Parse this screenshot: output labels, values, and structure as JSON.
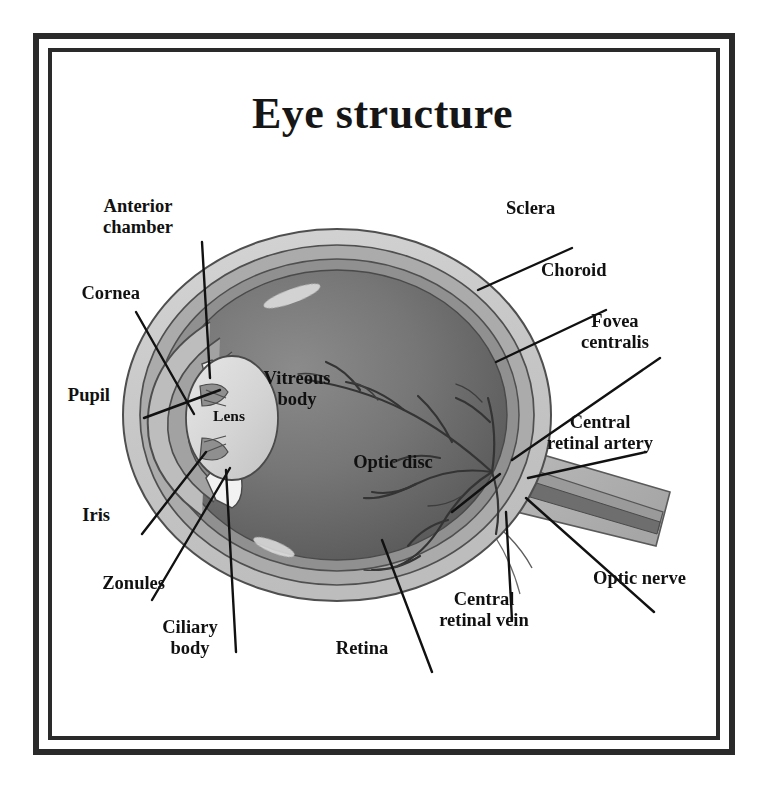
{
  "document": {
    "title": "Eye structure",
    "type": "anatomical-diagram",
    "frame": {
      "style": "double-rule",
      "color": "#2a2a2a"
    }
  },
  "palette": {
    "ink": "#161616",
    "background": "#ffffff",
    "sclera": "#c9c9c9",
    "choroid": "#a3a3a3",
    "retina": "#8d8d8d",
    "vitreous": "#6f6f6f",
    "vitreous_dark": "#5a5a5a",
    "lens": "#d7d7d7",
    "cornea": "#b5b5b5",
    "iris": "#8a8a8a",
    "nerve": "#b0b0b0",
    "vessel": "#3a3a3a"
  },
  "labels": [
    {
      "id": "anterior-chamber",
      "text": "Anterior\nchamber",
      "align": "center",
      "x": 138,
      "y": 196
    },
    {
      "id": "cornea",
      "text": "Cornea",
      "align": "right",
      "x": 30,
      "y": 283
    },
    {
      "id": "pupil",
      "text": "Pupil",
      "align": "right",
      "x": 30,
      "y": 385
    },
    {
      "id": "iris",
      "text": "Iris",
      "align": "right",
      "x": 30,
      "y": 505
    },
    {
      "id": "zonules",
      "text": "Zonules",
      "align": "right",
      "x": 30,
      "y": 573
    },
    {
      "id": "ciliary-body",
      "text": "Ciliary\nbody",
      "align": "center",
      "x": 190,
      "y": 617
    },
    {
      "id": "retina",
      "text": "Retina",
      "align": "center",
      "x": 362,
      "y": 638
    },
    {
      "id": "central-retinal-vein",
      "text": "Central\nretinal vein",
      "align": "center",
      "x": 484,
      "y": 589
    },
    {
      "id": "optic-nerve",
      "text": "Optic nerve",
      "align": "left",
      "x": 593,
      "y": 568
    },
    {
      "id": "central-retinal-artery",
      "text": "Central\nretinal artery",
      "align": "center",
      "x": 598,
      "y": 412
    },
    {
      "id": "fovea-centralis",
      "text": "Fovea\ncentralis",
      "align": "center",
      "x": 615,
      "y": 311
    },
    {
      "id": "choroid",
      "text": "Choroid",
      "align": "left",
      "x": 541,
      "y": 260
    },
    {
      "id": "sclera",
      "text": "Sclera",
      "align": "left",
      "x": 506,
      "y": 198
    },
    {
      "id": "vitreous-body",
      "text": "Vitreous\nbody",
      "align": "center",
      "x": 297,
      "y": 368
    },
    {
      "id": "optic-disc",
      "text": "Optic disc",
      "align": "center",
      "x": 393,
      "y": 452
    },
    {
      "id": "lens",
      "text": "Lens",
      "align": "center",
      "x": 229,
      "y": 407
    }
  ],
  "structures": [
    "sclera",
    "choroid",
    "retina",
    "vitreous body",
    "lens",
    "cornea",
    "iris",
    "pupil",
    "anterior chamber",
    "ciliary body",
    "zonules",
    "optic disc",
    "optic nerve",
    "fovea centralis",
    "central retinal artery",
    "central retinal vein"
  ]
}
